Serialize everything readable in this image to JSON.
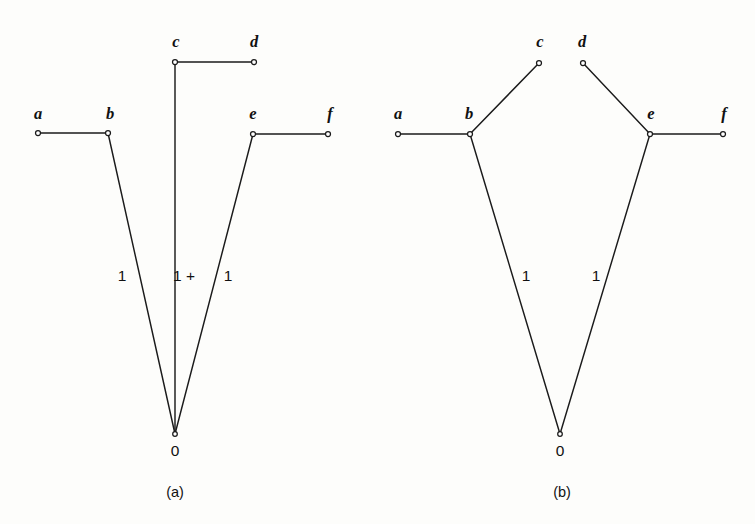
{
  "figure": {
    "background_color": "#fdfdfb",
    "line_color": "#1b1b1b",
    "node_fill": "#ffffff",
    "panels": [
      {
        "id": "panel-a",
        "caption": "(a)",
        "caption_x": 175,
        "caption_y": 497,
        "root": {
          "label": "0",
          "x": 175,
          "y": 434,
          "label_x": 175,
          "label_y": 456
        },
        "nodes": [
          {
            "id": "a",
            "label": "a",
            "x": 38,
            "y": 133,
            "label_x": 38,
            "label_y": 119
          },
          {
            "id": "b",
            "label": "b",
            "x": 108,
            "y": 133,
            "label_x": 110,
            "label_y": 119
          },
          {
            "id": "c",
            "label": "c",
            "x": 175,
            "y": 62,
            "label_x": 176,
            "label_y": 47
          },
          {
            "id": "d",
            "label": "d",
            "x": 254,
            "y": 62,
            "label_x": 254,
            "label_y": 47
          },
          {
            "id": "e",
            "label": "e",
            "x": 253,
            "y": 134,
            "label_x": 253,
            "label_y": 119
          },
          {
            "id": "f",
            "label": "f",
            "x": 328,
            "y": 134,
            "label_x": 330,
            "label_y": 119
          }
        ],
        "edges": [
          {
            "id": "a-b",
            "from": "a",
            "to": "b"
          },
          {
            "id": "b-root",
            "from": "b",
            "to": "root"
          },
          {
            "id": "c-d",
            "from": "c",
            "to": "d"
          },
          {
            "id": "c-root",
            "from": "c",
            "to": "root"
          },
          {
            "id": "e-f",
            "from": "e",
            "to": "f"
          },
          {
            "id": "e-root",
            "from": "e",
            "to": "root"
          }
        ],
        "edge_labels": [
          {
            "id": "label-left",
            "text": "1",
            "x": 122,
            "y": 281
          },
          {
            "id": "label-middle",
            "text": "1 +",
            "x": 184,
            "y": 281
          },
          {
            "id": "label-right",
            "text": "1",
            "x": 228,
            "y": 281
          }
        ]
      },
      {
        "id": "panel-b",
        "caption": "(b)",
        "caption_x": 562,
        "caption_y": 497,
        "root": {
          "label": "0",
          "x": 560,
          "y": 434,
          "label_x": 560,
          "label_y": 456
        },
        "nodes": [
          {
            "id": "a",
            "label": "a",
            "x": 398,
            "y": 134,
            "label_x": 398,
            "label_y": 119
          },
          {
            "id": "b",
            "label": "b",
            "x": 470,
            "y": 134,
            "label_x": 469,
            "label_y": 119
          },
          {
            "id": "c",
            "label": "c",
            "x": 539,
            "y": 63,
            "label_x": 540,
            "label_y": 47
          },
          {
            "id": "d",
            "label": "d",
            "x": 583,
            "y": 63,
            "label_x": 582,
            "label_y": 47
          },
          {
            "id": "e",
            "label": "e",
            "x": 650,
            "y": 134,
            "label_x": 651,
            "label_y": 119
          },
          {
            "id": "f",
            "label": "f",
            "x": 723,
            "y": 134,
            "label_x": 724,
            "label_y": 119
          }
        ],
        "edges": [
          {
            "id": "a-b",
            "from": "a",
            "to": "b"
          },
          {
            "id": "b-c",
            "from": "b",
            "to": "c"
          },
          {
            "id": "b-root",
            "from": "b",
            "to": "root"
          },
          {
            "id": "d-e",
            "from": "d",
            "to": "e"
          },
          {
            "id": "e-f",
            "from": "e",
            "to": "f"
          },
          {
            "id": "e-root",
            "from": "e",
            "to": "root"
          }
        ],
        "edge_labels": [
          {
            "id": "label-left",
            "text": "1",
            "x": 526,
            "y": 281
          },
          {
            "id": "label-right",
            "text": "1",
            "x": 596,
            "y": 281
          }
        ]
      }
    ]
  }
}
